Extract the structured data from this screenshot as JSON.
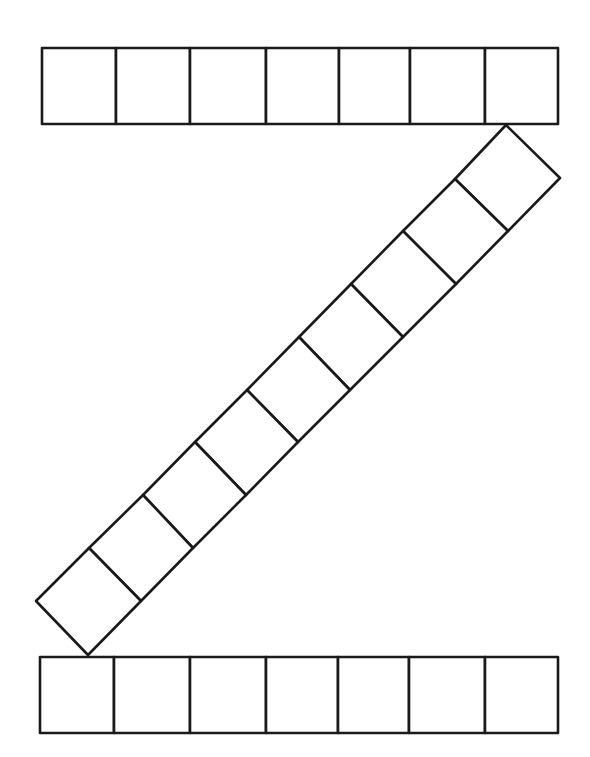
{
  "diagram": {
    "title": "",
    "stroke_color": "#1a1a1a",
    "fill_color": "#ffffff",
    "background": "#ffffff",
    "top_row": {
      "count": 7,
      "y_top": 48,
      "y_bottom": 124,
      "x_dividers": [
        42,
        116,
        190,
        266,
        339,
        410,
        485,
        558
      ]
    },
    "diagonal_band": {
      "count": 9,
      "upper_edge": [
        [
          506,
          125
        ],
        [
          455,
          179
        ],
        [
          403,
          231
        ],
        [
          351,
          284
        ],
        [
          299,
          337
        ],
        [
          247,
          390
        ],
        [
          195,
          442
        ],
        [
          143,
          495
        ],
        [
          89,
          548
        ],
        [
          36,
          601
        ]
      ],
      "lower_edge": [
        [
          560,
          178
        ],
        [
          508,
          231
        ],
        [
          456,
          284
        ],
        [
          403,
          337
        ],
        [
          350,
          390
        ],
        [
          298,
          442
        ],
        [
          246,
          495
        ],
        [
          193,
          548
        ],
        [
          141,
          601
        ],
        [
          88,
          655
        ]
      ]
    },
    "bottom_row": {
      "count": 7,
      "y_top": 657,
      "y_bottom": 733,
      "x_dividers": [
        40,
        114,
        190,
        266,
        338,
        409,
        485,
        558
      ]
    }
  }
}
